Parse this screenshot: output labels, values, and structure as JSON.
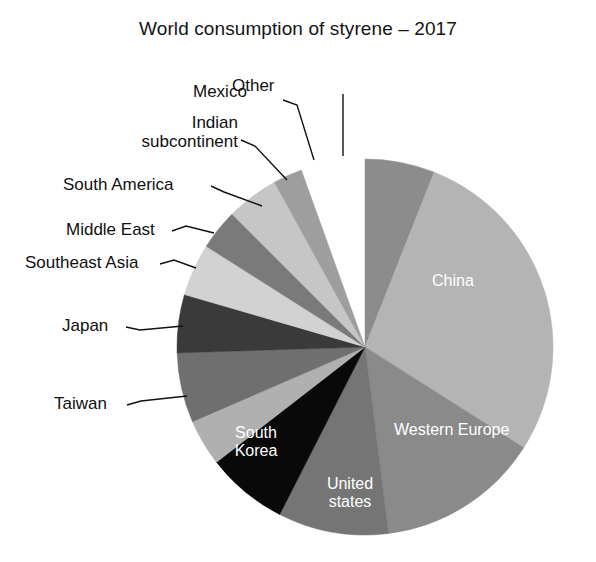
{
  "chart_data": {
    "type": "pie",
    "title": "World consumption of styrene – 2017",
    "xlabel": "",
    "ylabel": "",
    "legend_position": "none",
    "grid": false,
    "categories": [
      "Other",
      "China",
      "Western Europe",
      "United states",
      "South Korea",
      "Taiwan",
      "Japan",
      "Southeast Asia",
      "Middle East",
      "South America",
      "Indian subcontinent",
      "Mexico"
    ],
    "values": [
      6.0,
      28.0,
      14.0,
      9.5,
      7.0,
      4.0,
      6.0,
      5.0,
      4.5,
      3.5,
      4.5,
      2.5
    ],
    "slices": [
      {
        "label": "Other",
        "value": 6.0,
        "color": "#8c8c8c",
        "start_deg": 0.0,
        "end_deg": 21.6,
        "label_style": "callout"
      },
      {
        "label": "China",
        "value": 28.0,
        "color": "#b4b4b4",
        "start_deg": 21.6,
        "end_deg": 122.4,
        "label_style": "inner"
      },
      {
        "label": "Western Europe",
        "value": 14.0,
        "color": "#8a8a8a",
        "start_deg": 122.4,
        "end_deg": 172.8,
        "label_style": "inner"
      },
      {
        "label": "United states",
        "value": 9.5,
        "color": "#757575",
        "start_deg": 172.8,
        "end_deg": 207.0,
        "label_style": "inner"
      },
      {
        "label": "South Korea",
        "value": 7.0,
        "color": "#090909",
        "start_deg": 207.0,
        "end_deg": 232.2,
        "label_style": "inner"
      },
      {
        "label": "Taiwan",
        "value": 4.0,
        "color": "#b0b0b0",
        "start_deg": 232.2,
        "end_deg": 246.6,
        "label_style": "callout"
      },
      {
        "label": "Japan",
        "value": 6.0,
        "color": "#6f6f6f",
        "start_deg": 246.6,
        "end_deg": 268.2,
        "label_style": "callout"
      },
      {
        "label": "Southeast Asia",
        "value": 5.0,
        "color": "#3a3a3a",
        "start_deg": 268.2,
        "end_deg": 286.2,
        "label_style": "callout"
      },
      {
        "label": "Middle East",
        "value": 4.5,
        "color": "#d2d2d2",
        "start_deg": 286.2,
        "end_deg": 302.4,
        "label_style": "callout"
      },
      {
        "label": "South America",
        "value": 3.5,
        "color": "#7a7a7a",
        "start_deg": 302.4,
        "end_deg": 315.0,
        "label_style": "callout"
      },
      {
        "label": "Indian subcontinent",
        "value": 4.5,
        "color": "#c6c6c6",
        "start_deg": 315.0,
        "end_deg": 331.2,
        "label_style": "callout"
      },
      {
        "label": "Mexico",
        "value": 2.5,
        "color": "#9e9e9e",
        "start_deg": 331.2,
        "end_deg": 340.2,
        "label_style": "callout"
      }
    ],
    "geometry": {
      "center_x": 365,
      "center_y": 347,
      "radius": 188
    }
  },
  "title": {
    "text": "World consumption of styrene – 2017"
  },
  "callouts": {
    "mexico": "Mexico",
    "other": "Other",
    "indian_line1": "Indian",
    "indian_line2": "subcontinent",
    "south_america": "South America",
    "middle_east": "Middle East",
    "southeast_asia": "Southeast Asia",
    "japan": "Japan",
    "taiwan": "Taiwan"
  },
  "inner_labels": {
    "china": "China",
    "western_europe": "Western Europe",
    "united_states_line1": "United",
    "united_states_line2": "states",
    "south_korea_line1": "South",
    "south_korea_line2": "Korea"
  }
}
